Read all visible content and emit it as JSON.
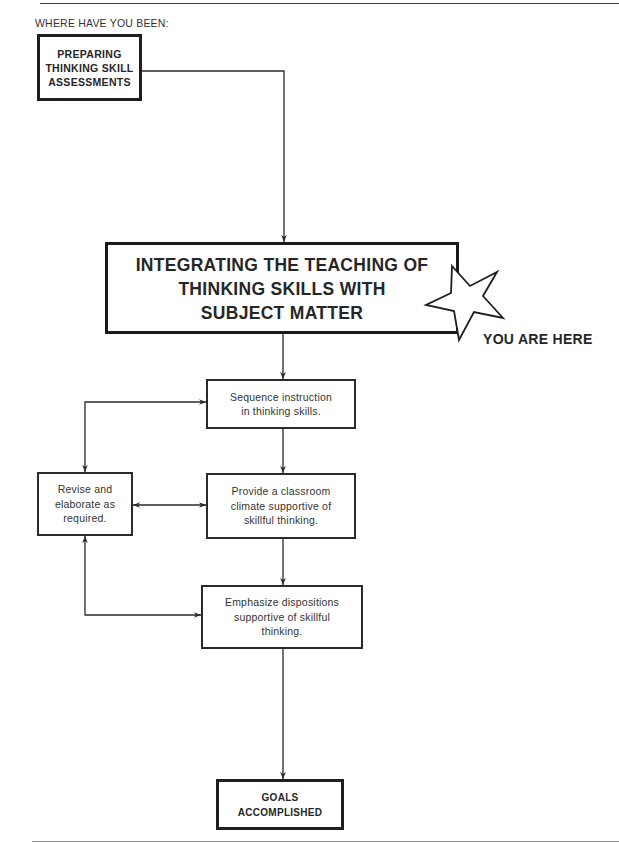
{
  "header": {
    "label": "WHERE HAVE YOU BEEN:"
  },
  "flowchart": {
    "previous_step": {
      "label": "PREPARING\nTHINKING SKILL\nASSESSMENTS"
    },
    "current_step": {
      "label": "INTEGRATING THE TEACHING OF\nTHINKING SKILLS WITH\nSUBJECT MATTER",
      "marker_icon": "star-icon",
      "marker_label": "YOU ARE HERE"
    },
    "steps": [
      {
        "id": "sequence",
        "label": "Sequence instruction\nin thinking skills."
      },
      {
        "id": "provide",
        "label": "Provide a classroom\nclimate supportive of\nskillful thinking."
      },
      {
        "id": "emphasize",
        "label": "Emphasize dispositions\nsupportive of skillful\nthinking."
      }
    ],
    "feedback_step": {
      "label": "Revise and\nelaborate as\nrequired."
    },
    "goal": {
      "label": "GOALS\nACCOMPLISHED"
    }
  },
  "colors": {
    "line": "#2a2a2a",
    "text": "#2a2a2a",
    "background": "#ffffff"
  }
}
